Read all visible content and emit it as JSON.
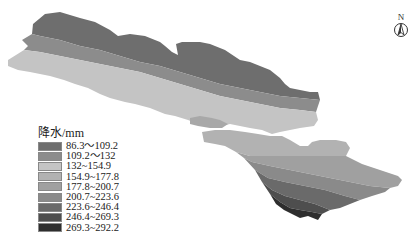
{
  "map": {
    "title": "",
    "north_arrow": {
      "label": "N",
      "icon": "north-arrow-icon"
    },
    "legend": {
      "title": "降水/mm",
      "classes": [
        {
          "range": "86.3～109.2",
          "color": "#6e6e6e"
        },
        {
          "range": "109.2～132",
          "color": "#8c8c8c"
        },
        {
          "range": "132~154.9",
          "color": "#c4c4c4"
        },
        {
          "range": "154.9~177.8",
          "color": "#b2b2b2"
        },
        {
          "range": "177.8~200.7",
          "color": "#a0a0a0"
        },
        {
          "range": "200.7~223.6",
          "color": "#8a8a8a"
        },
        {
          "range": "223.6~246.4",
          "color": "#6a6a6a"
        },
        {
          "range": "246.4~269.3",
          "color": "#4e4e4e"
        },
        {
          "range": "269.3~292.2",
          "color": "#2e2e2e"
        }
      ]
    }
  }
}
